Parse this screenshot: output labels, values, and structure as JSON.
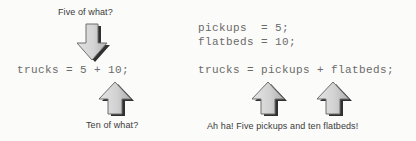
{
  "background_color": "#fbfbf9",
  "arrow_colors": {
    "fill_light": "#dcdcdc",
    "fill_dark": "#b4b4b4",
    "outline": "#6b6b6b",
    "shadow": "#1a1a1a"
  },
  "text_colors": {
    "code": "#6a6a6a",
    "caption": "#3a3a3a"
  },
  "left_group": {
    "caption_top": "Five of what?",
    "code_line": "trucks = 5 + 10;",
    "caption_bottom": "Ten of what?",
    "arrow_down_name": "down-arrow-icon",
    "arrow_up_name": "up-arrow-icon"
  },
  "right_group": {
    "declaration_lines": [
      "pickups  = 5;",
      "flatbeds = 10;"
    ],
    "code_line": "trucks = pickups + flatbeds;",
    "caption_bottom": "Ah ha! Five pickups and ten flatbeds!",
    "arrow_up_pickups_name": "up-arrow-icon",
    "arrow_up_flatbeds_name": "up-arrow-icon"
  }
}
